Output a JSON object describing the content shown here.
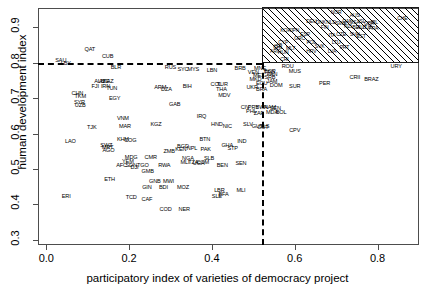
{
  "chart_data": {
    "type": "scatter",
    "title": "",
    "xlabel": "participatory index of varieties of democracy project",
    "ylabel": "human development index",
    "xlim": [
      -0.02,
      0.9
    ],
    "ylim": [
      0.285,
      0.955
    ],
    "xticks": [
      0.0,
      0.2,
      0.4,
      0.6,
      0.8
    ],
    "xticklabels": [
      "0.0",
      "0.2",
      "0.4",
      "0.6",
      "0.8"
    ],
    "yticks": [
      0.3,
      0.4,
      0.5,
      0.6,
      0.7,
      0.8,
      0.9
    ],
    "yticklabels": [
      "0.3",
      "0.4",
      "0.5",
      "0.6",
      "0.7",
      "0.8",
      "0.9"
    ],
    "grid": false,
    "legend": "none",
    "marker_style": "country-code-text-labels",
    "annotations": {
      "hline": {
        "y": 0.8,
        "style": "dashed",
        "color": "#000000",
        "label": "human development index = 0.8"
      },
      "vline": {
        "x": 0.52,
        "style": "dashed",
        "color": "#000000",
        "label": "participatory index = 0.52"
      },
      "highlight_box": {
        "x0": 0.52,
        "x1": 0.9,
        "y0": 0.8,
        "y1": 0.955,
        "fill": "diagonal-hatch",
        "label": "high democracy & high HDI quadrant"
      }
    },
    "points": [
      {
        "code": "QAT",
        "x": 0.105,
        "y": 0.836
      },
      {
        "code": "SAU",
        "x": 0.035,
        "y": 0.806
      },
      {
        "code": "CUB",
        "x": 0.148,
        "y": 0.816
      },
      {
        "code": "LBY",
        "x": 0.047,
        "y": 0.797
      },
      {
        "code": "BLR",
        "x": 0.168,
        "y": 0.786
      },
      {
        "code": "RUS",
        "x": 0.3,
        "y": 0.784
      },
      {
        "code": "SYC",
        "x": 0.33,
        "y": 0.78
      },
      {
        "code": "MYS",
        "x": 0.355,
        "y": 0.779
      },
      {
        "code": "LBN",
        "x": 0.4,
        "y": 0.778
      },
      {
        "code": "BRB",
        "x": 0.468,
        "y": 0.783
      },
      {
        "code": "MNE",
        "x": 0.516,
        "y": 0.783
      },
      {
        "code": "VEN",
        "x": 0.5,
        "y": 0.771
      },
      {
        "code": "TTO",
        "x": 0.538,
        "y": 0.772
      },
      {
        "code": "ISR",
        "x": 0.56,
        "y": 0.845
      },
      {
        "code": "CRI",
        "x": 0.575,
        "y": 0.807
      },
      {
        "code": "ROU",
        "x": 0.583,
        "y": 0.787
      },
      {
        "code": "URY",
        "x": 0.845,
        "y": 0.788
      },
      {
        "code": "AZE",
        "x": 0.14,
        "y": 0.745
      },
      {
        "code": "ALB",
        "x": 0.128,
        "y": 0.747
      },
      {
        "code": "KAZ",
        "x": 0.15,
        "y": 0.746
      },
      {
        "code": "FJI",
        "x": 0.118,
        "y": 0.733
      },
      {
        "code": "IRN",
        "x": 0.143,
        "y": 0.733
      },
      {
        "code": "TUN",
        "x": 0.158,
        "y": 0.727
      },
      {
        "code": "ARM",
        "x": 0.275,
        "y": 0.73
      },
      {
        "code": "DZA",
        "x": 0.29,
        "y": 0.722
      },
      {
        "code": "BIH",
        "x": 0.34,
        "y": 0.733
      },
      {
        "code": "TUR",
        "x": 0.425,
        "y": 0.736
      },
      {
        "code": "COL",
        "x": 0.41,
        "y": 0.737
      },
      {
        "code": "CHN",
        "x": 0.075,
        "y": 0.712
      },
      {
        "code": "TKM",
        "x": 0.082,
        "y": 0.704
      },
      {
        "code": "EGY",
        "x": 0.165,
        "y": 0.699
      },
      {
        "code": "THA",
        "x": 0.423,
        "y": 0.724
      },
      {
        "code": "UKR",
        "x": 0.497,
        "y": 0.73
      },
      {
        "code": "BGR",
        "x": 0.54,
        "y": 0.773
      },
      {
        "code": "MEX",
        "x": 0.513,
        "y": 0.762
      },
      {
        "code": "PAN",
        "x": 0.545,
        "y": 0.765
      },
      {
        "code": "SRB",
        "x": 0.54,
        "y": 0.757
      },
      {
        "code": "MKD",
        "x": 0.505,
        "y": 0.752
      },
      {
        "code": "BRA",
        "x": 0.52,
        "y": 0.724
      },
      {
        "code": "MDV",
        "x": 0.43,
        "y": 0.706
      },
      {
        "code": "SYR",
        "x": 0.08,
        "y": 0.687
      },
      {
        "code": "UZB",
        "x": 0.082,
        "y": 0.678
      },
      {
        "code": "GAB",
        "x": 0.31,
        "y": 0.68
      },
      {
        "code": "MUS",
        "x": 0.6,
        "y": 0.775
      },
      {
        "code": "PER",
        "x": 0.672,
        "y": 0.74
      },
      {
        "code": "CRII",
        "x": 0.745,
        "y": 0.756
      },
      {
        "code": "BRAZ",
        "x": 0.785,
        "y": 0.752
      },
      {
        "code": "ECU",
        "x": 0.52,
        "y": 0.74
      },
      {
        "code": "JAM",
        "x": 0.545,
        "y": 0.745
      },
      {
        "code": "DOM",
        "x": 0.555,
        "y": 0.735
      },
      {
        "code": "SUR",
        "x": 0.6,
        "y": 0.733
      },
      {
        "code": "VNM",
        "x": 0.185,
        "y": 0.64
      },
      {
        "code": "MAR",
        "x": 0.19,
        "y": 0.62
      },
      {
        "code": "TJK",
        "x": 0.11,
        "y": 0.615
      },
      {
        "code": "KGZ",
        "x": 0.265,
        "y": 0.623
      },
      {
        "code": "IRQ",
        "x": 0.375,
        "y": 0.648
      },
      {
        "code": "HND",
        "x": 0.412,
        "y": 0.625
      },
      {
        "code": "NIC",
        "x": 0.437,
        "y": 0.62
      },
      {
        "code": "SLV",
        "x": 0.487,
        "y": 0.624
      },
      {
        "code": "GUY",
        "x": 0.51,
        "y": 0.618
      },
      {
        "code": "TLS",
        "x": 0.527,
        "y": 0.62
      },
      {
        "code": "CIV",
        "x": 0.48,
        "y": 0.672
      },
      {
        "code": "PRY",
        "x": 0.5,
        "y": 0.672
      },
      {
        "code": "BWA",
        "x": 0.52,
        "y": 0.672
      },
      {
        "code": "NAM",
        "x": 0.54,
        "y": 0.672
      },
      {
        "code": "SEN",
        "x": 0.553,
        "y": 0.67
      },
      {
        "code": "PHL",
        "x": 0.495,
        "y": 0.66
      },
      {
        "code": "ZAF",
        "x": 0.513,
        "y": 0.655
      },
      {
        "code": "MDA",
        "x": 0.545,
        "y": 0.658
      },
      {
        "code": "BOL",
        "x": 0.567,
        "y": 0.657
      },
      {
        "code": "GUT",
        "x": 0.523,
        "y": 0.617
      },
      {
        "code": "CPV",
        "x": 0.6,
        "y": 0.608
      },
      {
        "code": "LAO",
        "x": 0.058,
        "y": 0.576
      },
      {
        "code": "SWZ",
        "x": 0.145,
        "y": 0.566
      },
      {
        "code": "MRT",
        "x": 0.148,
        "y": 0.558
      },
      {
        "code": "AGO",
        "x": 0.15,
        "y": 0.55
      },
      {
        "code": "KHM",
        "x": 0.185,
        "y": 0.583
      },
      {
        "code": "COG",
        "x": 0.203,
        "y": 0.58
      },
      {
        "code": "BTN",
        "x": 0.383,
        "y": 0.583
      },
      {
        "code": "BGD",
        "x": 0.33,
        "y": 0.563
      },
      {
        "code": "KEN",
        "x": 0.325,
        "y": 0.553
      },
      {
        "code": "NPL",
        "x": 0.352,
        "y": 0.556
      },
      {
        "code": "PAK",
        "x": 0.385,
        "y": 0.553
      },
      {
        "code": "ZMB",
        "x": 0.297,
        "y": 0.548
      },
      {
        "code": "GHA",
        "x": 0.437,
        "y": 0.565
      },
      {
        "code": "STP",
        "x": 0.45,
        "y": 0.557
      },
      {
        "code": "IND",
        "x": 0.472,
        "y": 0.575
      },
      {
        "code": "MDG",
        "x": 0.205,
        "y": 0.53
      },
      {
        "code": "CMR",
        "x": 0.252,
        "y": 0.53
      },
      {
        "code": "YEM",
        "x": 0.197,
        "y": 0.52
      },
      {
        "code": "NGA",
        "x": 0.342,
        "y": 0.528
      },
      {
        "code": "SDN",
        "x": 0.205,
        "y": 0.508
      },
      {
        "code": "TGO",
        "x": 0.233,
        "y": 0.508
      },
      {
        "code": "AFC",
        "x": 0.182,
        "y": 0.508
      },
      {
        "code": "DJI",
        "x": 0.213,
        "y": 0.503
      },
      {
        "code": "RWA",
        "x": 0.285,
        "y": 0.507
      },
      {
        "code": "MLI",
        "x": 0.335,
        "y": 0.518
      },
      {
        "code": "TZA",
        "x": 0.355,
        "y": 0.517
      },
      {
        "code": "UGA",
        "x": 0.368,
        "y": 0.515
      },
      {
        "code": "SLB",
        "x": 0.393,
        "y": 0.528
      },
      {
        "code": "COM",
        "x": 0.378,
        "y": 0.518
      },
      {
        "code": "BEN",
        "x": 0.425,
        "y": 0.508
      },
      {
        "code": "SEN2",
        "x": 0.47,
        "y": 0.513
      },
      {
        "code": "GMB",
        "x": 0.245,
        "y": 0.492
      },
      {
        "code": "ETH",
        "x": 0.153,
        "y": 0.468
      },
      {
        "code": "GNB",
        "x": 0.262,
        "y": 0.462
      },
      {
        "code": "MWI",
        "x": 0.295,
        "y": 0.463
      },
      {
        "code": "GIN",
        "x": 0.243,
        "y": 0.447
      },
      {
        "code": "BDI",
        "x": 0.283,
        "y": 0.447
      },
      {
        "code": "MOZ",
        "x": 0.33,
        "y": 0.445
      },
      {
        "code": "LBR",
        "x": 0.418,
        "y": 0.437
      },
      {
        "code": "MLI2",
        "x": 0.47,
        "y": 0.437
      },
      {
        "code": "SLE",
        "x": 0.412,
        "y": 0.422
      },
      {
        "code": "BFA",
        "x": 0.428,
        "y": 0.427
      },
      {
        "code": "ERI",
        "x": 0.048,
        "y": 0.42
      },
      {
        "code": "TCD",
        "x": 0.205,
        "y": 0.418
      },
      {
        "code": "CAF",
        "x": 0.243,
        "y": 0.412
      },
      {
        "code": "COD",
        "x": 0.288,
        "y": 0.383
      },
      {
        "code": "NER",
        "x": 0.333,
        "y": 0.383
      },
      {
        "code": "CHE",
        "x": 0.86,
        "y": 0.925
      },
      {
        "code": "NOR",
        "x": 0.7,
        "y": 0.94
      },
      {
        "code": "AUS",
        "x": 0.745,
        "y": 0.933
      },
      {
        "code": "DEU",
        "x": 0.64,
        "y": 0.915
      },
      {
        "code": "DNK",
        "x": 0.663,
        "y": 0.913
      },
      {
        "code": "NLD",
        "x": 0.688,
        "y": 0.912
      },
      {
        "code": "SWE",
        "x": 0.712,
        "y": 0.91
      },
      {
        "code": "CAN",
        "x": 0.727,
        "y": 0.915
      },
      {
        "code": "USA",
        "x": 0.745,
        "y": 0.912
      },
      {
        "code": "ISL",
        "x": 0.762,
        "y": 0.916
      },
      {
        "code": "GBR",
        "x": 0.78,
        "y": 0.91
      },
      {
        "code": "IRL",
        "x": 0.792,
        "y": 0.914
      },
      {
        "code": "FIN",
        "x": 0.672,
        "y": 0.898
      },
      {
        "code": "NZL",
        "x": 0.73,
        "y": 0.9
      },
      {
        "code": "BEL",
        "x": 0.75,
        "y": 0.898
      },
      {
        "code": "AUT",
        "x": 0.762,
        "y": 0.898
      },
      {
        "code": "LUX",
        "x": 0.775,
        "y": 0.898
      },
      {
        "code": "FRA",
        "x": 0.79,
        "y": 0.896
      },
      {
        "code": "JPN",
        "x": 0.6,
        "y": 0.89
      },
      {
        "code": "ESP",
        "x": 0.625,
        "y": 0.878
      },
      {
        "code": "ITA",
        "x": 0.69,
        "y": 0.877
      },
      {
        "code": "SVN",
        "x": 0.745,
        "y": 0.88
      },
      {
        "code": "CZE",
        "x": 0.712,
        "y": 0.878
      },
      {
        "code": "KOR",
        "x": 0.578,
        "y": 0.89
      },
      {
        "code": "EST",
        "x": 0.76,
        "y": 0.873
      },
      {
        "code": "GRC",
        "x": 0.612,
        "y": 0.866
      },
      {
        "code": "CYP",
        "x": 0.572,
        "y": 0.856
      },
      {
        "code": "POL",
        "x": 0.64,
        "y": 0.855
      },
      {
        "code": "LTU",
        "x": 0.7,
        "y": 0.857
      },
      {
        "code": "SVK",
        "x": 0.66,
        "y": 0.844
      },
      {
        "code": "PRT",
        "x": 0.72,
        "y": 0.843
      },
      {
        "code": "LVA",
        "x": 0.69,
        "y": 0.832
      },
      {
        "code": "HRV",
        "x": 0.64,
        "y": 0.83
      },
      {
        "code": "CHL",
        "x": 0.56,
        "y": 0.843
      },
      {
        "code": "ARG",
        "x": 0.553,
        "y": 0.83
      },
      {
        "code": "HUN",
        "x": 0.572,
        "y": 0.828
      },
      {
        "code": "MLT",
        "x": 0.59,
        "y": 0.84
      }
    ]
  }
}
